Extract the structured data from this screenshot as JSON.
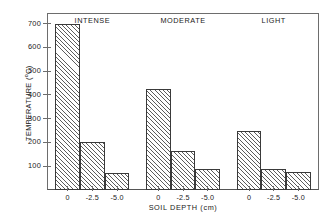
{
  "chart_data": {
    "type": "bar",
    "title": "",
    "subtitle": "",
    "xlabel": "SOIL DEPTH (cm)",
    "ylabel": "TEMPERATURE (°C)",
    "ylabel_text": "TEMPERATURE (",
    "ylabel_unit": "o",
    "ylabel_tail": "C)",
    "ylim": [
      0,
      745
    ],
    "yticks": [
      100,
      200,
      300,
      400,
      500,
      600,
      700
    ],
    "ytick_labels": [
      "100",
      "200",
      "300",
      "400",
      "500",
      "600",
      "700"
    ],
    "grid": false,
    "legend": "none",
    "categories": [
      "0",
      "-2.5",
      "-5.0"
    ],
    "groups": [
      {
        "name": "INTENSE",
        "categories": [
          "0",
          "-2.5",
          "-5.0"
        ],
        "values": [
          700,
          200,
          70
        ]
      },
      {
        "name": "MODERATE",
        "categories": [
          "0",
          "-2.5",
          "-5.0"
        ],
        "values": [
          425,
          165,
          90
        ]
      },
      {
        "name": "LIGHT",
        "categories": [
          "0",
          "-2.5",
          "-5.0"
        ],
        "values": [
          250,
          90,
          75
        ]
      }
    ],
    "bar_style": {
      "fill": "#ffffff",
      "hatch": "diagonal-45",
      "hatch_color": "#5c5c5c",
      "edge_color": "#3a3a3a"
    },
    "axes_color": "#6d6d6d",
    "text_color": "#1a1a1a",
    "background": "#ffffff"
  }
}
